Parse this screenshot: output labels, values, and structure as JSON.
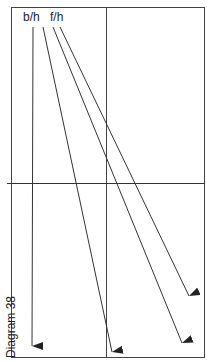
{
  "labels": {
    "left": "b/h",
    "right": "f/h"
  },
  "caption": "Diagram 38",
  "colors": {
    "line": "#333333",
    "background": "#ffffff"
  }
}
